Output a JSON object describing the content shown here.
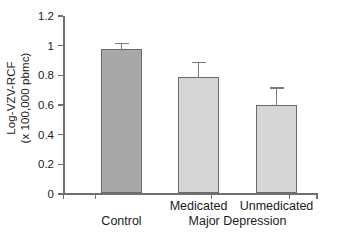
{
  "chart_data": {
    "type": "bar",
    "title": "",
    "xlabel": "",
    "ylabel_line1": "Log-VZV-RCF",
    "ylabel_line2": "(x 100,000 pbmc)",
    "categories": [
      "Control",
      "Medicated",
      "Unmedicated"
    ],
    "group_label": "Major Depression",
    "group_members": [
      "Medicated",
      "Unmedicated"
    ],
    "values": [
      0.97,
      0.78,
      0.59
    ],
    "errors_upper": [
      0.05,
      0.11,
      0.13
    ],
    "error_tops": [
      1.02,
      0.89,
      0.72
    ],
    "bar_colors": [
      "#a8a8a8",
      "#d6d6d6",
      "#d6d6d6"
    ],
    "bar_border_color": "#6a6a6a",
    "ylim": [
      0,
      1.2
    ],
    "ytick_values": [
      0,
      0.2,
      0.4,
      0.6,
      0.8,
      1,
      1.2
    ],
    "ytick_labels": [
      "0",
      "0.2",
      "0.4",
      "0.6",
      "0.8",
      "1",
      "1.2"
    ],
    "grid": false,
    "legend": "none",
    "axis_color": "#6f6f6f"
  }
}
